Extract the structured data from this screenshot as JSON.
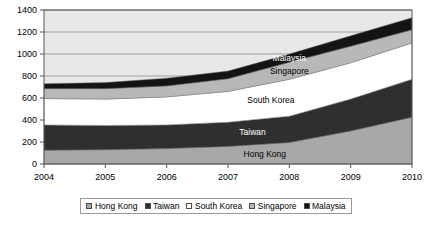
{
  "chart_data": {
    "type": "area",
    "title": "",
    "subtitle": "",
    "xlabel": "",
    "ylabel": "",
    "stacked": true,
    "grid": true,
    "legend_position": "bottom",
    "xlim": [
      2004,
      2010
    ],
    "ylim": [
      0,
      1400
    ],
    "ytick_step": 200,
    "categories": [
      "2004",
      "2005",
      "2006",
      "2007",
      "2008",
      "2009",
      "2010"
    ],
    "x": [
      2004,
      2005,
      2006,
      2007,
      2008,
      2009,
      2010
    ],
    "xticks": [
      "2004",
      "2005",
      "2006",
      "2007",
      "2008",
      "2009",
      "2010"
    ],
    "yticks": [
      "0",
      "200",
      "400",
      "600",
      "800",
      "1000",
      "1200",
      "1400"
    ],
    "series": [
      {
        "name": "Hong Kong",
        "color": "#a8a8a8",
        "values": [
          125,
          130,
          140,
          160,
          195,
          300,
          425
        ]
      },
      {
        "name": "Taiwan",
        "color": "#2f2f2f",
        "values": [
          230,
          220,
          215,
          220,
          240,
          290,
          345
        ]
      },
      {
        "name": "South Korea",
        "color": "#ffffff",
        "values": [
          240,
          240,
          255,
          280,
          335,
          330,
          330
        ]
      },
      {
        "name": "Singapore",
        "color": "#b8b8b8",
        "values": [
          90,
          95,
          100,
          115,
          155,
          150,
          120
        ]
      },
      {
        "name": "Malaysia",
        "color": "#141414",
        "values": [
          45,
          55,
          70,
          70,
          75,
          95,
          110
        ]
      }
    ],
    "series_totals": [
      730,
      740,
      780,
      845,
      1000,
      1165,
      1330
    ],
    "annotations": [
      {
        "text": "Malaysia",
        "series": "Malaysia",
        "x": 2008,
        "on_dark": true
      },
      {
        "text": "Singapore",
        "series": "Singapore",
        "x": 2008,
        "on_dark": false
      },
      {
        "text": "South Korea",
        "series": "South Korea",
        "x": 2007.7,
        "on_dark": false
      },
      {
        "text": "Taiwan",
        "series": "Taiwan",
        "x": 2007.4,
        "on_dark": true
      },
      {
        "text": "Hong Kong",
        "series": "Hong Kong",
        "x": 2007.6,
        "on_dark": false
      }
    ]
  },
  "legend": {
    "items": [
      {
        "label": "Hong Kong",
        "color": "#a8a8a8"
      },
      {
        "label": "Taiwan",
        "color": "#2f2f2f"
      },
      {
        "label": "South Korea",
        "color": "#ffffff"
      },
      {
        "label": "Singapore",
        "color": "#b8b8b8"
      },
      {
        "label": "Malaysia",
        "color": "#141414"
      }
    ]
  },
  "plot": {
    "background_color": "#e8e8e8",
    "gridline_color": "#808080",
    "axis_color": "#555555"
  }
}
